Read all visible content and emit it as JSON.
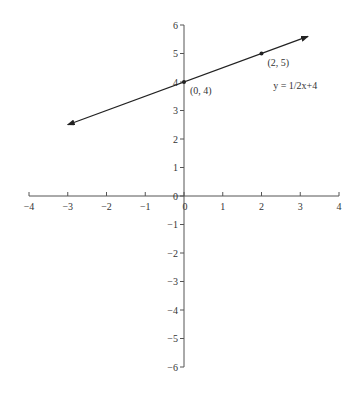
{
  "chart_data": {
    "type": "line",
    "title": "",
    "xlabel": "",
    "ylabel": "",
    "xlim": [
      -4,
      4
    ],
    "ylim": [
      -6,
      6
    ],
    "grid": false,
    "x_ticks": [
      -4,
      -3,
      -2,
      -1,
      0,
      1,
      2,
      3,
      4
    ],
    "y_ticks": [
      -6,
      -5,
      -4,
      -3,
      -2,
      -1,
      0,
      1,
      2,
      3,
      4,
      5,
      6
    ],
    "series": [
      {
        "name": "y = 1/2x+4",
        "equation": "y = 0.5x + 4",
        "x": [
          -3,
          3.2
        ],
        "y": [
          2.5,
          5.6
        ],
        "arrows_both_ends": true
      }
    ],
    "points": [
      {
        "x": 0,
        "y": 4,
        "label": "(0, 4)"
      },
      {
        "x": 2,
        "y": 5,
        "label": "(2, 5)"
      }
    ],
    "annotations": [
      {
        "text": "y = 1/2x+4",
        "x": 2.3,
        "y": 3.75
      }
    ]
  },
  "colors": {
    "axis": "#555555",
    "line": "#222222",
    "text": "#333333"
  }
}
